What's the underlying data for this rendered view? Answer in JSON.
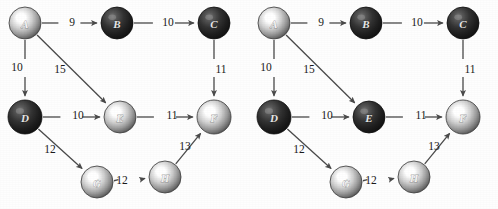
{
  "figure": {
    "background_color": "#fefefe",
    "edge_color": "#4a4a4a",
    "panel_count": 2
  },
  "graph": {
    "nodes": [
      {
        "id": "A",
        "label": "A",
        "x": 25,
        "y": 23,
        "r": 16
      },
      {
        "id": "B",
        "label": "B",
        "x": 117,
        "y": 23,
        "r": 16
      },
      {
        "id": "C",
        "label": "C",
        "x": 214,
        "y": 23,
        "r": 16
      },
      {
        "id": "D",
        "label": "D",
        "x": 25,
        "y": 117,
        "r": 17
      },
      {
        "id": "E",
        "label": "E",
        "x": 120,
        "y": 117,
        "r": 16
      },
      {
        "id": "F",
        "label": "F",
        "x": 214,
        "y": 117,
        "r": 17
      },
      {
        "id": "G",
        "label": "G",
        "x": 97,
        "y": 182,
        "r": 16
      },
      {
        "id": "H",
        "label": "H",
        "x": 165,
        "y": 177,
        "r": 16
      }
    ],
    "edges": [
      {
        "from": "A",
        "to": "B",
        "weight": "9",
        "lx": 72,
        "ly": 23
      },
      {
        "from": "B",
        "to": "C",
        "weight": "10",
        "lx": 168,
        "ly": 23
      },
      {
        "from": "A",
        "to": "D",
        "weight": "10",
        "lx": 17,
        "ly": 68
      },
      {
        "from": "A",
        "to": "E",
        "weight": "15",
        "lx": 60,
        "ly": 70
      },
      {
        "from": "C",
        "to": "F",
        "weight": "11",
        "lx": 221,
        "ly": 70
      },
      {
        "from": "D",
        "to": "E",
        "weight": "10",
        "lx": 78,
        "ly": 116
      },
      {
        "from": "E",
        "to": "F",
        "weight": "11",
        "lx": 172,
        "ly": 116
      },
      {
        "from": "D",
        "to": "G",
        "weight": "12",
        "lx": 50,
        "ly": 150
      },
      {
        "from": "G",
        "to": "H",
        "weight": "12",
        "lx": 122,
        "ly": 181
      },
      {
        "from": "H",
        "to": "F",
        "weight": "13",
        "lx": 185,
        "ly": 147
      }
    ]
  },
  "panels": [
    {
      "name": "left-graph",
      "caption": "",
      "node_shading": {
        "A": "light",
        "B": "dark",
        "C": "dark",
        "D": "dark",
        "E": "light",
        "F": "light",
        "G": "light",
        "H": "light"
      }
    },
    {
      "name": "right-graph",
      "caption": "",
      "node_shading": {
        "A": "light",
        "B": "dark",
        "C": "dark",
        "D": "dark",
        "E": "dark",
        "F": "light",
        "G": "light",
        "H": "light"
      }
    }
  ],
  "colors": {
    "node_light_highlight": "#ffffff",
    "node_light_mid": "#b8b8b8",
    "node_light_rim": "#4a4a4a",
    "node_dark_highlight": "#6e6e6e",
    "node_dark_mid": "#2e2e2e",
    "node_dark_rim": "#101010",
    "edge": "#4a4a4a",
    "text": "#1a1a1a",
    "background": "#fefefe"
  }
}
